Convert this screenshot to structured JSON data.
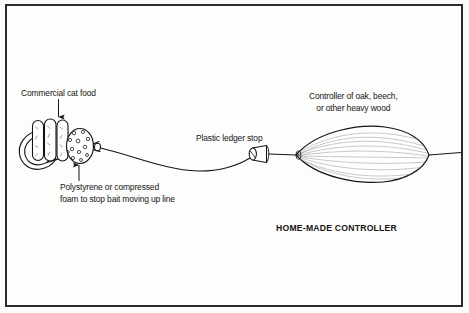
{
  "figure": {
    "caption": "HOME-MADE CONTROLLER",
    "background_color": "#fdfdfb",
    "ink_color": "#151515",
    "border_color": "#2b2b2b"
  },
  "labels": {
    "cat_food": "Commercial cat food",
    "polystyrene_line1": "Polystyrene or compressed",
    "polystyrene_line2": "foam to stop bait moving up line",
    "ledger_stop": "Plastic ledger stop",
    "controller_line1": "Controller of oak, beech,",
    "controller_line2": "or other heavy wood"
  },
  "parts": {
    "hook": "fishing-hook",
    "cat_food_pellets": 3,
    "foam_ball": "speckled-foam-ball",
    "fishing_line": "monofilament-line",
    "ledger_stop": "plastic-ledger-stop-bead",
    "controller": "wooden-lens-shaped-controller"
  }
}
